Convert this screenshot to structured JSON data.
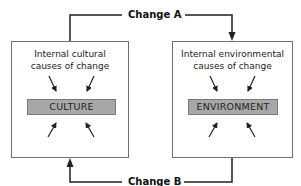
{
  "diagram": {
    "left_box": {
      "title_line1": "Internal cultural",
      "title_line2": "causes of change",
      "core_label": "CULTURE"
    },
    "right_box": {
      "title_line1": "Internal environmental",
      "title_line2": "causes of change",
      "core_label": "ENVIRONMENT"
    },
    "connectors": {
      "top_label": "Change A",
      "bottom_label": "Change B"
    },
    "colors": {
      "line": "#222222",
      "box_border": "#6f6f6f",
      "core_fill": "#a8a8a8"
    }
  }
}
